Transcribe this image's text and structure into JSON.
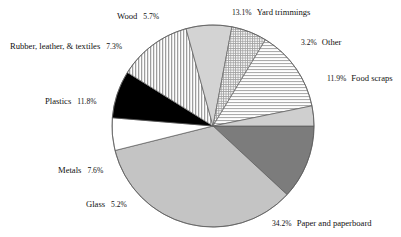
{
  "chart_data": {
    "type": "pie",
    "title": "",
    "subtitle": "",
    "xlabel": "",
    "ylabel": "",
    "legend_position": "callout-labels",
    "grid": false,
    "unit": "%",
    "total": 100.0,
    "start_angle_deg": 0,
    "direction": "clockwise",
    "categories": [
      "Food scraps",
      "Paper and paperboard",
      "Glass",
      "Metals",
      "Plastics",
      "Rubber, leather, & textiles",
      "Wood",
      "Yard trimmings",
      "Other"
    ],
    "values": [
      11.9,
      34.2,
      5.2,
      7.6,
      11.8,
      7.3,
      5.7,
      13.1,
      3.2
    ],
    "labels": [
      "11.9%",
      "34.2%",
      "5.2%",
      "7.6%",
      "11.8%",
      "7.3%",
      "5.7%",
      "13.1%",
      "3.2%"
    ],
    "slices": [
      {
        "name": "Food scraps",
        "value": 11.9,
        "label": "11.9%",
        "fill": "#7c7c7c",
        "pattern": "solid",
        "label_side": "right",
        "label_x": 327,
        "label_y": 74
      },
      {
        "name": "Paper and paperboard",
        "value": 34.2,
        "label": "34.2%",
        "fill": "#c4c4c4",
        "pattern": "solid",
        "label_side": "right",
        "label_x": 272,
        "label_y": 219
      },
      {
        "name": "Glass",
        "value": 5.2,
        "label": "5.2%",
        "fill": "#ffffff",
        "pattern": "solid",
        "label_side": "left",
        "label_x": 86,
        "label_y": 200
      },
      {
        "name": "Metals",
        "value": 7.6,
        "label": "7.6%",
        "fill": "#000000",
        "pattern": "solid",
        "label_side": "left",
        "label_x": 58,
        "label_y": 166
      },
      {
        "name": "Plastics",
        "value": 11.8,
        "label": "11.8%",
        "fill": "#e8e8e8",
        "pattern": "vertical-lines",
        "label_side": "left",
        "label_x": 45,
        "label_y": 97
      },
      {
        "name": "Rubber, leather, & textiles",
        "value": 7.3,
        "label": "7.3%",
        "fill": "#d3d3d3",
        "pattern": "solid",
        "label_side": "left",
        "label_x": 10,
        "label_y": 42
      },
      {
        "name": "Wood",
        "value": 5.7,
        "label": "5.7%",
        "fill": "#e0e0e0",
        "pattern": "crosshatch",
        "label_side": "left",
        "label_x": 117,
        "label_y": 12
      },
      {
        "name": "Yard trimmings",
        "value": 13.1,
        "label": "13.1%",
        "fill": "#f2f2f2",
        "pattern": "horizontal-lines",
        "label_side": "right",
        "label_x": 232,
        "label_y": 8
      },
      {
        "name": "Other",
        "value": 3.2,
        "label": "3.2%",
        "fill": "#cfcfcf",
        "pattern": "solid",
        "label_side": "right",
        "label_x": 301,
        "label_y": 38
      }
    ],
    "geometry": {
      "center_x": 213,
      "center_y": 126,
      "radius_x": 101,
      "radius_y": 101,
      "stroke": "#5a5a5a",
      "stroke_width": 0.7
    }
  }
}
